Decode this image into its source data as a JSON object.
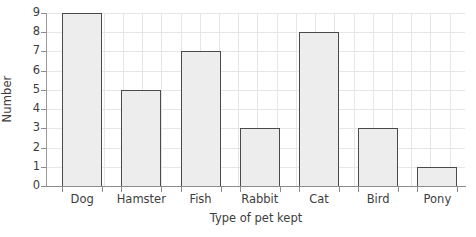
{
  "chart_data": {
    "type": "bar",
    "title": "",
    "categories": [
      "Dog",
      "Hamster",
      "Fish",
      "Rabbit",
      "Cat",
      "Bird",
      "Pony"
    ],
    "values": [
      9,
      5,
      7,
      3,
      8,
      3,
      1
    ],
    "xlabel": "Type of pet kept",
    "ylabel": "Number",
    "ylim": [
      0,
      9
    ],
    "yticks": [
      0,
      1,
      2,
      3,
      4,
      5,
      6,
      7,
      8,
      9
    ],
    "ytick_labels": [
      "0",
      "1",
      "2",
      "3",
      "4",
      "5",
      "6",
      "7",
      "8",
      "9"
    ],
    "grid": true,
    "grid_orientation": "both",
    "legend": false,
    "legend_position": "none",
    "bar_fill_color": "#ededed",
    "bar_edge_color": "#4a4a4a",
    "grid_color": "#e6e6e6",
    "axis_color": "#8c8c8c",
    "text_color": "#3d3d3d",
    "background_color": "#ffffff"
  },
  "axes": {
    "y_title": "Number",
    "x_title": "Type of pet kept"
  }
}
